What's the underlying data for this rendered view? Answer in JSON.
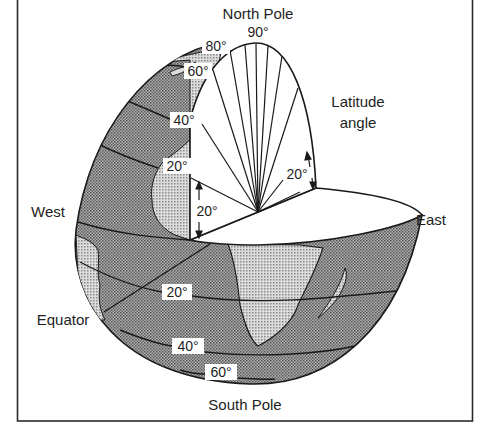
{
  "figure": {
    "labels": {
      "north_pole": "North Pole",
      "north_pole_angle": "90°",
      "south_pole": "South Pole",
      "west": "West",
      "east": "East",
      "equator": "Equator",
      "latitude_angle_line1": "Latitude",
      "latitude_angle_line2": "angle"
    },
    "northern_latitudes": [
      {
        "label": "80°"
      },
      {
        "label": "60°"
      },
      {
        "label": "40°"
      },
      {
        "label": "20°"
      }
    ],
    "southern_latitudes": [
      {
        "label": "20°"
      },
      {
        "label": "40°"
      },
      {
        "label": "60°"
      }
    ],
    "angle_markers": [
      {
        "label": "20°",
        "position": "left-cut-face"
      },
      {
        "label": "20°",
        "position": "right-cut-face"
      }
    ],
    "colors": {
      "frame": "#2a2a2a",
      "ocean_fill": "#9a9a9a",
      "land_fill": "#c4c4c4",
      "cut_face": "#ffffff",
      "line": "#1a1a1a"
    }
  }
}
